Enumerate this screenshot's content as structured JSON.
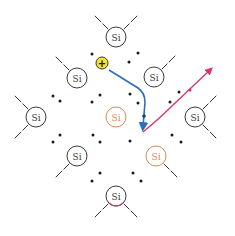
{
  "diagram": {
    "colors": {
      "atom_default": "#3a3a3a",
      "atom_highlight": "#d9895a",
      "bond": "#333333",
      "electron": "#1a1a1a",
      "hole_fill": "#f2e33a",
      "hole_stroke": "#3a3a1a",
      "hole_path": "#2e6bc4",
      "electron_path": "#d9336a"
    },
    "atoms": [
      {
        "label": "Si",
        "x": 116,
        "y": 37,
        "highlight": false,
        "bonds": [
          [
            -1,
            -1
          ],
          [
            1,
            -1
          ]
        ]
      },
      {
        "label": "Si",
        "x": 77,
        "y": 78,
        "highlight": false,
        "bonds": [
          [
            -1,
            -1
          ]
        ]
      },
      {
        "label": "Si",
        "x": 154,
        "y": 77,
        "highlight": false,
        "bonds": [
          [
            1,
            -1
          ]
        ]
      },
      {
        "label": "Si",
        "x": 36,
        "y": 117,
        "highlight": false,
        "bonds": [
          [
            -1,
            -1
          ],
          [
            -1,
            1
          ]
        ]
      },
      {
        "label": "Si",
        "x": 116,
        "y": 117,
        "highlight": true,
        "bonds": []
      },
      {
        "label": "Si",
        "x": 195,
        "y": 117,
        "highlight": false,
        "bonds": [
          [
            1,
            -1
          ],
          [
            1,
            1
          ]
        ]
      },
      {
        "label": "Si",
        "x": 77,
        "y": 156,
        "highlight": false,
        "bonds": [
          [
            -1,
            1
          ]
        ]
      },
      {
        "label": "Si",
        "x": 156,
        "y": 156,
        "highlight": true,
        "bonds": [
          [
            1,
            1
          ]
        ]
      },
      {
        "label": "Si",
        "x": 116,
        "y": 196,
        "highlight": false,
        "bonds": [
          [
            -1,
            1
          ],
          [
            1,
            1
          ]
        ],
        "red_arc": true
      }
    ],
    "electrons": [
      [
        92,
        54
      ],
      [
        138,
        53
      ],
      [
        129,
        62
      ],
      [
        53,
        96
      ],
      [
        60,
        101
      ],
      [
        92,
        102
      ],
      [
        100,
        95
      ],
      [
        130,
        94
      ],
      [
        138,
        103
      ],
      [
        144,
        116
      ],
      [
        170,
        102
      ],
      [
        179,
        92
      ],
      [
        60,
        135
      ],
      [
        53,
        142
      ],
      [
        93,
        135
      ],
      [
        100,
        142
      ],
      [
        130,
        141
      ],
      [
        172,
        135
      ],
      [
        181,
        142
      ],
      [
        100,
        173
      ],
      [
        92,
        181
      ],
      [
        133,
        173
      ],
      [
        141,
        181
      ]
    ],
    "hole": {
      "label": "+",
      "x": 102,
      "y": 63,
      "r": 6
    },
    "hole_path": {
      "d": "M109,70 L138,88 Q145,93 145,102 L143,127",
      "marker_dot": [
        144,
        116
      ]
    },
    "electron_path": {
      "d": "M143,132 Q160,118 172,106 L210,70",
      "marker_dot": [
        190,
        90
      ]
    }
  }
}
